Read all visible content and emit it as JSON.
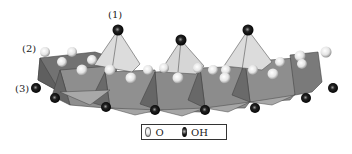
{
  "figure": {
    "labels": {
      "apical": "(1)",
      "basal_oxygen": "(2)",
      "octahedral_oh": "(3)"
    },
    "legend": {
      "items": [
        {
          "symbol": "white-sphere",
          "label": "O",
          "color": "#e8e8e8"
        },
        {
          "symbol": "black-sphere",
          "label": "OH",
          "color": "#111111"
        }
      ]
    },
    "colors": {
      "tetrahedron_face": "#dcdcdc",
      "octahedron_dark": "#6e6e6e",
      "octahedron_mid": "#8c8c8c",
      "octahedron_light": "#a6a6a6",
      "oxygen": "#eeeeee",
      "hydroxyl": "#111111"
    }
  }
}
